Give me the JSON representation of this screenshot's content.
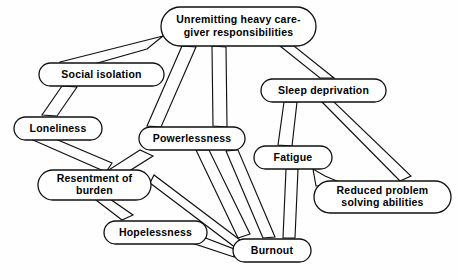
{
  "diagram": {
    "type": "concept-map",
    "background_color": "#fefefe",
    "line_color": "#111111",
    "node_fill": "#ffffff",
    "nodes": [
      {
        "id": "responsibilities",
        "lines": [
          "Unremitting heavy care-",
          "giver responsibilities"
        ],
        "x": 161,
        "y": 7,
        "w": 155,
        "h": 39,
        "font_size": 10.5
      },
      {
        "id": "social-isolation",
        "lines": [
          "Social isolation"
        ],
        "x": 39,
        "y": 63,
        "w": 125,
        "h": 23,
        "font_size": 10.5
      },
      {
        "id": "sleep-deprivation",
        "lines": [
          "Sleep deprivation"
        ],
        "x": 261,
        "y": 79,
        "w": 125,
        "h": 23,
        "font_size": 10.5
      },
      {
        "id": "loneliness",
        "lines": [
          "Loneliness"
        ],
        "x": 14,
        "y": 117,
        "w": 88,
        "h": 23,
        "font_size": 10.5
      },
      {
        "id": "powerlessness",
        "lines": [
          "Powerlessness"
        ],
        "x": 139,
        "y": 127,
        "w": 106,
        "h": 23,
        "font_size": 10.5
      },
      {
        "id": "fatigue",
        "lines": [
          "Fatigue"
        ],
        "x": 254,
        "y": 146,
        "w": 78,
        "h": 23,
        "font_size": 10.5
      },
      {
        "id": "resentment",
        "lines": [
          "Resentment of",
          "burden"
        ],
        "x": 38,
        "y": 170,
        "w": 113,
        "h": 30,
        "font_size": 10.5
      },
      {
        "id": "reduced-problem-solving",
        "lines": [
          "Reduced problem",
          "solving abilities"
        ],
        "x": 314,
        "y": 181,
        "w": 137,
        "h": 32,
        "font_size": 10.5
      },
      {
        "id": "hopelessness",
        "lines": [
          "Hopelessness"
        ],
        "x": 104,
        "y": 221,
        "w": 103,
        "h": 23,
        "font_size": 10.5
      },
      {
        "id": "burnout",
        "lines": [
          "Burnout"
        ],
        "x": 233,
        "y": 239,
        "w": 78,
        "h": 23,
        "font_size": 10.5
      }
    ],
    "links": [
      {
        "id": "isolation-to-responsibilities",
        "from": "social-isolation",
        "to": "responsibilities",
        "band": "M 60,62 L 163,36 L 147,49 L 62,73 Z"
      },
      {
        "id": "isolation-to-loneliness",
        "from": "social-isolation",
        "to": "loneliness",
        "band": "M 62,86 L 42,115 L 57,116 L 77,87 Z"
      },
      {
        "id": "responsibilities-to-powerlessness-left",
        "from": "responsibilities",
        "to": "powerlessness",
        "band": "M 182,46 L 147,126 L 161,127 L 196,47 Z"
      },
      {
        "id": "responsibilities-to-powerlessness-right",
        "from": "responsibilities",
        "to": "powerlessness",
        "band": "M 212,46 L 213,126 L 227,127 L 226,47 Z"
      },
      {
        "id": "responsibilities-to-sleep",
        "from": "responsibilities",
        "to": "sleep-deprivation",
        "band": "M 280,46 L 320,78 L 334,78 L 294,46 Z"
      },
      {
        "id": "loneliness-to-resentment",
        "from": "loneliness",
        "to": "resentment",
        "band": "M 33,140 L 106,172 L 112,163 L 39,132 Z"
      },
      {
        "id": "powerlessness-to-resentment",
        "from": "powerlessness",
        "to": "resentment",
        "band": "M 140,150 L 104,173 L 118,178 L 153,156 Z"
      },
      {
        "id": "powerlessness-to-burnout",
        "from": "powerlessness",
        "to": "burnout",
        "band": "M 196,150 L 238,238 L 250,234 L 209,150 Z"
      },
      {
        "id": "powerlessness-to-hopelessness-area",
        "from": "resentment",
        "to": "hopelessness",
        "band": "M 96,200 L 122,220 L 133,215 L 107,197 Z"
      },
      {
        "id": "resentment-to-burnout",
        "from": "resentment",
        "to": "burnout",
        "band": "M 150,183 L 236,248 L 240,240 L 154,175 Z"
      },
      {
        "id": "hopelessness-to-burnout",
        "from": "hopelessness",
        "to": "burnout",
        "band": "M 190,232 L 234,249 L 234,257 L 189,242 Z"
      },
      {
        "id": "burnout-to-powerlessness",
        "from": "burnout",
        "to": "powerlessness",
        "band": "M 263,238 L 226,151 L 238,150 L 275,237 Z"
      },
      {
        "id": "sleep-to-fatigue",
        "from": "sleep-deprivation",
        "to": "fatigue",
        "band": "M 284,102 L 278,145 L 292,146 L 297,102 Z"
      },
      {
        "id": "sleep-to-reduced-problem",
        "from": "sleep-deprivation",
        "to": "reduced-problem-solving",
        "band": "M 322,102 L 400,181 L 411,176 L 333,101 Z"
      },
      {
        "id": "fatigue-to-burnout",
        "from": "fatigue",
        "to": "burnout",
        "band": "M 286,169 L 283,238 L 295,238 L 298,169 Z"
      },
      {
        "id": "reduced-problem-to-fatigue",
        "from": "reduced-problem-solving",
        "to": "fatigue",
        "band": "M 316,186 L 313,169 L 325,176 L 344,184 Z"
      }
    ]
  }
}
